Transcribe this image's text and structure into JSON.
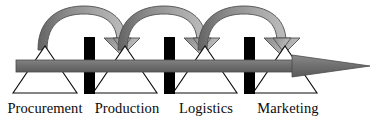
{
  "figure": {
    "type": "process-flow-diagram",
    "width": 379,
    "height": 120
  },
  "colors": {
    "background": "#ffffff",
    "main_arrow_fill": "#6f6f6f",
    "main_arrow_stroke": "#4a4a4a",
    "arc_dark": "#6a6a6a",
    "arc_light": "#b5b5b5",
    "arc_stroke": "#4f4f4f",
    "triangle_fill": "#ffffff",
    "triangle_stroke": "#0a0a0a",
    "pillar_fill": "#000000",
    "label_color": "#0a0a0a"
  },
  "stages": [
    {
      "id": "procurement",
      "label": "Procurement",
      "apex_x": 45,
      "label_x": 45,
      "order": 1
    },
    {
      "id": "production",
      "label": "Production",
      "apex_x": 125,
      "label_x": 127,
      "order": 2
    },
    {
      "id": "logistics",
      "label": "Logistics",
      "apex_x": 205,
      "label_x": 206,
      "order": 3
    },
    {
      "id": "marketing",
      "label": "Marketing",
      "apex_x": 285,
      "label_x": 288,
      "order": 4
    }
  ],
  "pillars": [
    {
      "id": "divider-1",
      "x": 85,
      "width": 11
    },
    {
      "id": "divider-2",
      "x": 165,
      "width": 11
    },
    {
      "id": "divider-3",
      "x": 245,
      "width": 11
    }
  ],
  "feedback_arcs": [
    {
      "id": "arc-procurement-to-production",
      "from": "procurement",
      "to": "production",
      "direction": "forward"
    },
    {
      "id": "arc-production-to-logistics",
      "from": "production",
      "to": "logistics",
      "direction": "forward"
    },
    {
      "id": "arc-logistics-to-marketing",
      "from": "logistics",
      "to": "marketing",
      "direction": "forward"
    }
  ],
  "main_flow": {
    "id": "main-process-arrow",
    "label": "",
    "start_x": 16,
    "tip_x": 370,
    "y": 66,
    "direction": "right"
  },
  "labels": {
    "stage_1": "Procurement",
    "stage_2": "Production",
    "stage_3": "Logistics",
    "stage_4": "Marketing"
  }
}
